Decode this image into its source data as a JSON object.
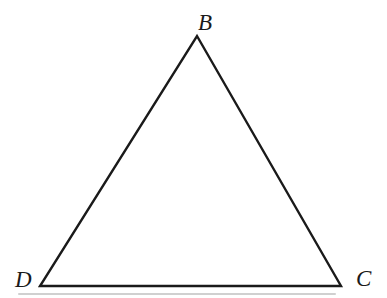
{
  "figure": {
    "type": "geometry-diagram",
    "shape": "triangle",
    "background": "#ffffff",
    "line_color": "#1a1a1a",
    "line_width": 2.4,
    "label_color": "#1a1a1a"
  },
  "triangle": {
    "vertices": [
      {
        "id": "B",
        "x": 197,
        "y": 36
      },
      {
        "id": "C",
        "x": 341,
        "y": 286
      },
      {
        "id": "D",
        "x": 40,
        "y": 286
      }
    ]
  },
  "labels": [
    {
      "text": "B",
      "x": 198,
      "y": 11
    },
    {
      "text": "D",
      "x": 15,
      "y": 268
    },
    {
      "text": "C",
      "x": 356,
      "y": 267
    }
  ]
}
